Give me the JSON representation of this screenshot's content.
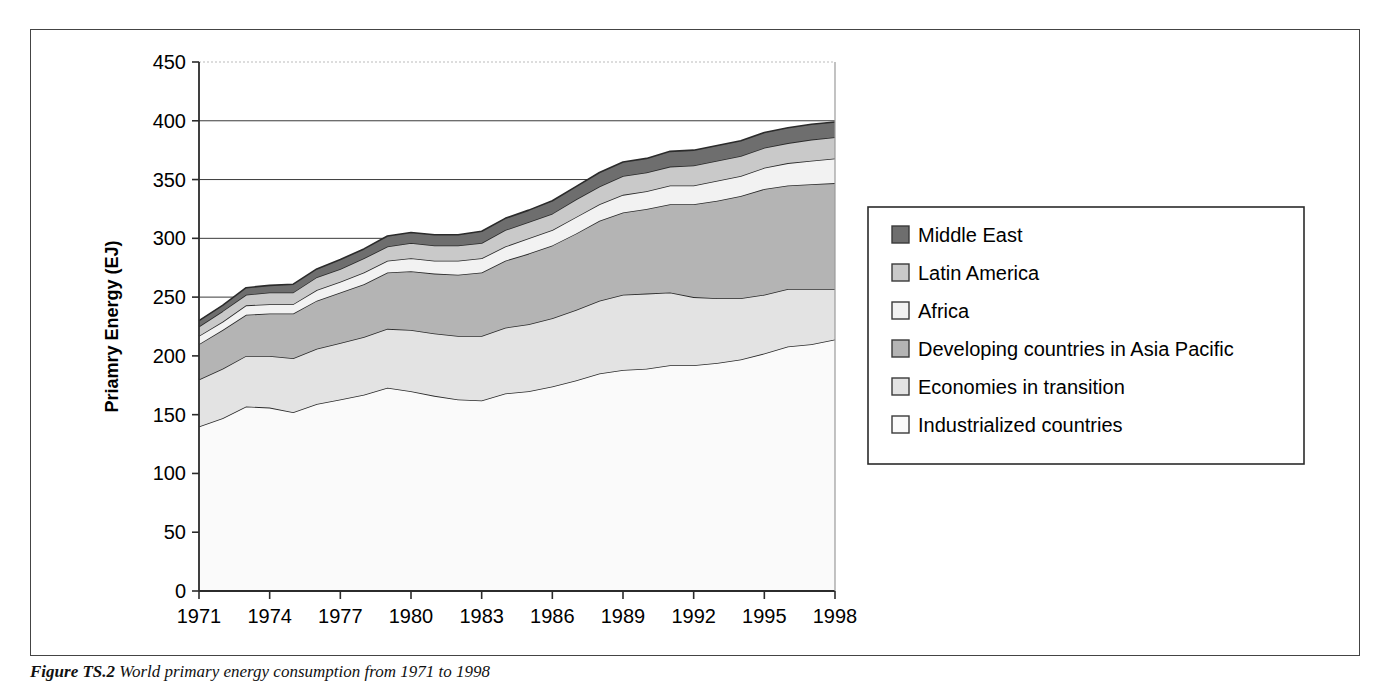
{
  "figure": {
    "caption_label": "Figure TS.2",
    "caption_text": "World primary energy consumption from 1971 to 1998"
  },
  "axes": {
    "y_title": "Priamry Energy (EJ)",
    "y_ticks": [
      "0",
      "50",
      "100",
      "150",
      "200",
      "250",
      "300",
      "350",
      "400",
      "450"
    ],
    "x_ticks": [
      "1971",
      "1974",
      "1977",
      "1980",
      "1983",
      "1986",
      "1989",
      "1992",
      "1995",
      "1998"
    ]
  },
  "legend": {
    "items": [
      {
        "label": "Middle East",
        "color": "#6e6e6e"
      },
      {
        "label": "Latin America",
        "color": "#c9c9c9"
      },
      {
        "label": "Africa",
        "color": "#f2f2f2"
      },
      {
        "label": "Developing countries in Asia Pacific",
        "color": "#b4b4b4"
      },
      {
        "label": "Economies in transition",
        "color": "#e3e3e3"
      },
      {
        "label": "Industrialized countries",
        "color": "#fafafa"
      }
    ]
  },
  "chart_data": {
    "type": "area",
    "stacked": true,
    "title": "",
    "xlabel": "",
    "ylabel": "Priamry Energy (EJ)",
    "xlim": [
      1971,
      1998
    ],
    "ylim": [
      0,
      450
    ],
    "ytick_step": 50,
    "grid": true,
    "legend_position": "right",
    "x": [
      1971,
      1972,
      1973,
      1974,
      1975,
      1976,
      1977,
      1978,
      1979,
      1980,
      1981,
      1982,
      1983,
      1984,
      1985,
      1986,
      1987,
      1988,
      1989,
      1990,
      1991,
      1992,
      1993,
      1994,
      1995,
      1996,
      1997,
      1998
    ],
    "series": [
      {
        "name": "Industrialized countries",
        "color": "#fafafa",
        "values": [
          140,
          147,
          157,
          156,
          152,
          159,
          163,
          167,
          173,
          170,
          166,
          163,
          162,
          168,
          170,
          174,
          179,
          185,
          188,
          189,
          192,
          192,
          194,
          197,
          202,
          208,
          210,
          214
        ]
      },
      {
        "name": "Economies in transition",
        "color": "#e3e3e3",
        "values": [
          40,
          42,
          43,
          44,
          46,
          47,
          48,
          49,
          50,
          52,
          53,
          54,
          55,
          56,
          57,
          58,
          60,
          62,
          64,
          64,
          62,
          58,
          55,
          52,
          50,
          49,
          47,
          43
        ]
      },
      {
        "name": "Developing countries in Asia Pacific",
        "color": "#b4b4b4",
        "values": [
          30,
          33,
          35,
          36,
          38,
          41,
          43,
          45,
          48,
          50,
          51,
          52,
          54,
          57,
          60,
          62,
          65,
          68,
          70,
          72,
          75,
          79,
          83,
          87,
          90,
          88,
          89,
          90
        ]
      },
      {
        "name": "Africa",
        "color": "#f2f2f2",
        "values": [
          7,
          7,
          8,
          8,
          8,
          9,
          9,
          10,
          10,
          11,
          11,
          12,
          12,
          12,
          13,
          13,
          14,
          14,
          15,
          15,
          16,
          16,
          17,
          17,
          18,
          19,
          20,
          21
        ]
      },
      {
        "name": "Latin America",
        "color": "#c9c9c9",
        "values": [
          8,
          9,
          9,
          10,
          10,
          11,
          11,
          12,
          12,
          13,
          13,
          13,
          13,
          14,
          14,
          14,
          15,
          15,
          16,
          16,
          16,
          17,
          17,
          17,
          17,
          17,
          18,
          18
        ]
      },
      {
        "name": "Middle East",
        "color": "#6e6e6e",
        "values": [
          5,
          5,
          6,
          6,
          7,
          7,
          8,
          8,
          9,
          9,
          9,
          9,
          10,
          10,
          10,
          11,
          11,
          12,
          12,
          12,
          13,
          13,
          13,
          13,
          13,
          13,
          13,
          13
        ]
      }
    ]
  }
}
